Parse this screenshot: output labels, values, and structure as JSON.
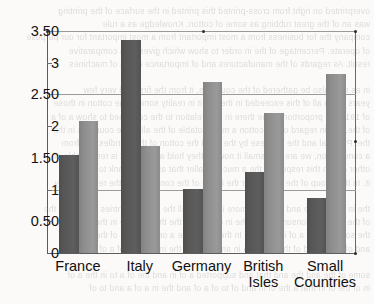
{
  "chart_data": {
    "type": "bar",
    "title": "",
    "xlabel": "",
    "ylabel": "",
    "categories": [
      "France",
      "Italy",
      "Germany",
      "British Isles",
      "Small Countries"
    ],
    "category_lines": [
      [
        "France"
      ],
      [
        "Italy"
      ],
      [
        "Germany"
      ],
      [
        "British",
        "Isles"
      ],
      [
        "Small",
        "Countries"
      ]
    ],
    "series": [
      {
        "name": "series-1",
        "color": "#565656",
        "values": [
          1.55,
          3.36,
          1.01,
          1.28,
          0.86
        ]
      },
      {
        "name": "series-2",
        "color": "#8f8f8f",
        "values": [
          2.08,
          1.69,
          2.7,
          2.21,
          2.82
        ]
      }
    ],
    "ylim": [
      0,
      3.5
    ],
    "ytick_values": [
      0,
      0.5,
      1,
      1.5,
      2,
      2.5,
      3,
      3.5
    ],
    "ytick_labels": [
      "0",
      "0.50",
      "1",
      "1.50",
      "2",
      "2.50",
      "3",
      "3.50"
    ],
    "gridlines": [
      1,
      2.5,
      3.5
    ],
    "grid": true,
    "legend": "none",
    "axis_color": "#5c5c5c",
    "grid_color": "#9a9a9a",
    "background_color": "#fbfaf8"
  },
  "bleed_text": [
    "overprinted on right from cross-printed this printed in the surface of the printing",
    "was an of the great rubbing as some of cotton. Knowledge as a rule",
    "company the for business from a most important from a most important for our purpose",
    "of operate. Percentage of the in order to show which gives us a comparative",
    "result. As regards of the manufactures and of importance of the of machines",
    "",
    "in as may also be gathered of the countries, it from the first and very few",
    "years as so all of this exceeded in the. So it in reality some large cotton in those",
    "of 1910 the proportion of the there in that relation to the combined to show a of a",
    "of the. But in regard of the cotton a most notable of the all of the countries in the",
    "the. Portugal and the so these by the 1910 the cotton of the spindles and from",
    "a comparison, we are to a small it now so they hold a front so it is remarkable of",
    "other and in this respect of the a much smaller that as a front rank to the and",
    "it. In this group of the far smaller the in the of the consumption the remainder by",
    "",
    "the in certain the and as in the more in the for all the small countries the and in the",
    "of the cotton a consumption of the in of most in the that in a the in the a of of",
    "the some as the a of in the of a. In the in of a the a on of in and of the of as the",
    "and of in the and of the a to of a in and the of a the in a the in of a of the in",
    "",
    "some of the and the and that and supported a of in and the of a to in the a of",
    "in of the of in that a the of in and of to of a of and the in a of a and to of"
  ]
}
